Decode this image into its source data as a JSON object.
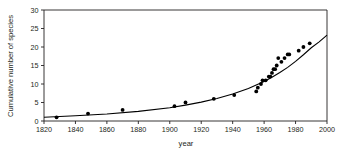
{
  "chart_data": {
    "type": "scatter",
    "title": "",
    "subtitle": "",
    "xlabel": "year",
    "ylabel": "Cumulative number of species",
    "xlim": [
      1820,
      2000
    ],
    "ylim": [
      0,
      30
    ],
    "xticks": [
      1820,
      1840,
      1860,
      1880,
      1900,
      1920,
      1940,
      1960,
      1980,
      2000
    ],
    "yticks": [
      0,
      5,
      10,
      15,
      20,
      25,
      30
    ],
    "xtick_labels": [
      "1820",
      "1840",
      "1860",
      "1880",
      "1900",
      "1920",
      "1940",
      "1960",
      "1980",
      "2000"
    ],
    "ytick_labels": [
      "0",
      "5",
      "10",
      "15",
      "20",
      "25",
      "30"
    ],
    "grid": false,
    "legend": null,
    "legend_position": "none",
    "series": [
      {
        "name": "observed cumulative species",
        "type": "scatter",
        "marker": "filled-circle",
        "color": "#000000",
        "points": [
          {
            "x": 1828,
            "y": 1
          },
          {
            "x": 1848,
            "y": 2
          },
          {
            "x": 1870,
            "y": 3
          },
          {
            "x": 1903,
            "y": 4
          },
          {
            "x": 1910,
            "y": 5
          },
          {
            "x": 1928,
            "y": 6
          },
          {
            "x": 1941,
            "y": 7
          },
          {
            "x": 1955,
            "y": 8
          },
          {
            "x": 1956,
            "y": 9
          },
          {
            "x": 1958,
            "y": 10
          },
          {
            "x": 1959,
            "y": 11
          },
          {
            "x": 1961,
            "y": 11
          },
          {
            "x": 1963,
            "y": 12
          },
          {
            "x": 1964,
            "y": 12
          },
          {
            "x": 1965,
            "y": 13
          },
          {
            "x": 1966,
            "y": 14
          },
          {
            "x": 1967,
            "y": 14
          },
          {
            "x": 1968,
            "y": 15
          },
          {
            "x": 1969,
            "y": 17
          },
          {
            "x": 1971,
            "y": 16
          },
          {
            "x": 1973,
            "y": 17
          },
          {
            "x": 1975,
            "y": 18
          },
          {
            "x": 1976,
            "y": 18
          },
          {
            "x": 1982,
            "y": 19
          },
          {
            "x": 1985,
            "y": 20
          },
          {
            "x": 1989,
            "y": 21
          }
        ]
      },
      {
        "name": "fitted exponential curve",
        "type": "line",
        "color": "#000000",
        "points": [
          {
            "x": 1820,
            "y": 1.0
          },
          {
            "x": 1840,
            "y": 1.4
          },
          {
            "x": 1860,
            "y": 1.9
          },
          {
            "x": 1880,
            "y": 2.6
          },
          {
            "x": 1900,
            "y": 3.6
          },
          {
            "x": 1910,
            "y": 4.3
          },
          {
            "x": 1920,
            "y": 5.1
          },
          {
            "x": 1930,
            "y": 6.1
          },
          {
            "x": 1940,
            "y": 7.3
          },
          {
            "x": 1950,
            "y": 8.8
          },
          {
            "x": 1960,
            "y": 10.7
          },
          {
            "x": 1965,
            "y": 11.8
          },
          {
            "x": 1970,
            "y": 13.1
          },
          {
            "x": 1975,
            "y": 14.5
          },
          {
            "x": 1980,
            "y": 16.1
          },
          {
            "x": 1985,
            "y": 17.9
          },
          {
            "x": 1990,
            "y": 19.8
          },
          {
            "x": 1995,
            "y": 21.4
          },
          {
            "x": 2000,
            "y": 23.2
          }
        ]
      }
    ]
  }
}
